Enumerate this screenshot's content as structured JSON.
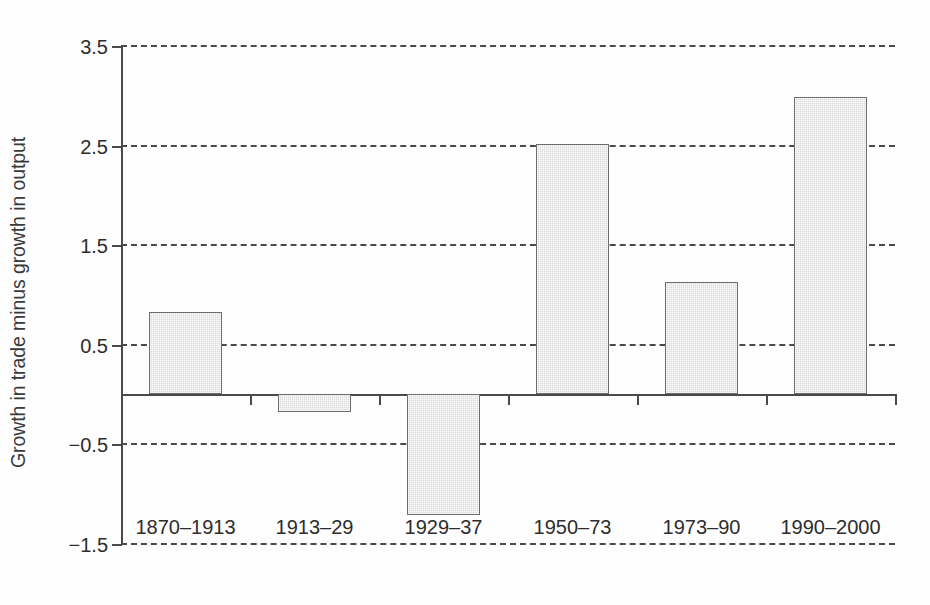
{
  "chart_data": {
    "type": "bar",
    "title": "",
    "subtitle": "",
    "xlabel": "",
    "ylabel": "Growth in trade minus growth in output",
    "categories": [
      "1870–1913",
      "1913–29",
      "1929–37",
      "1950–73",
      "1973–90",
      "1990–2000"
    ],
    "values": [
      0.82,
      -0.18,
      -1.22,
      2.51,
      1.12,
      2.98
    ],
    "ylim": [
      -1.5,
      3.5
    ],
    "yticks": [
      3.5,
      2.5,
      1.5,
      0.5,
      -0.5,
      -1.5
    ],
    "ytick_labels": [
      "3.5",
      "2.5",
      "1.5",
      "0.5",
      "−0.5",
      "−1.5"
    ],
    "zero_line": 0,
    "grid": true,
    "grid_style": "dashed",
    "grid_orientation": "horizontal",
    "legend": false,
    "legend_position": "none",
    "bar_fill_color": "#dcdcdc",
    "bar_edge_color": "#6e6e6e",
    "axis_color": "#4a4a4a",
    "background_color": "#ffffff",
    "series": [
      {
        "name": "Growth in trade minus growth in output",
        "values": [
          0.82,
          -0.18,
          -1.22,
          2.51,
          1.12,
          2.98
        ]
      }
    ]
  }
}
